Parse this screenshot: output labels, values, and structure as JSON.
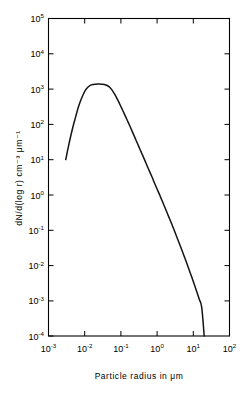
{
  "figure": {
    "background_color": "#ffffff",
    "ink_color": "#000000",
    "curve_color": "#141414"
  },
  "chart_data": {
    "type": "line",
    "title": "",
    "subtitle": "",
    "xlabel": "Particle  radius  in  μm",
    "ylabel": "dN/d(log r) cm⁻³ μm⁻¹",
    "xscale": "log",
    "yscale": "log",
    "xlim": [
      0.001,
      100
    ],
    "ylim": [
      0.0001,
      100000
    ],
    "grid": false,
    "legend": null,
    "legend_position": "none",
    "annotations": [],
    "xticks": [
      0.001,
      0.01,
      0.1,
      1,
      10,
      100
    ],
    "xtick_labels": [
      "10",
      "10",
      "10",
      "10",
      "10",
      "10"
    ],
    "xtick_exponents": [
      "-3",
      "-2",
      "-1",
      "0",
      "1",
      "2"
    ],
    "yticks": [
      0.0001,
      0.001,
      0.01,
      0.1,
      1,
      10,
      100,
      1000,
      10000,
      100000
    ],
    "ytick_labels": [
      "10",
      "10",
      "10",
      "10",
      "10",
      "10",
      "10",
      "10",
      "10",
      "10"
    ],
    "ytick_exponents": [
      "-4",
      "-3",
      "-2",
      "-1",
      "0",
      "1",
      "2",
      "3",
      "4",
      "5"
    ],
    "series": [
      {
        "name": "Aerosol size distribution",
        "x": [
          0.003,
          0.0035,
          0.0041,
          0.0048,
          0.0056,
          0.0065,
          0.0076,
          0.0089,
          0.0104,
          0.0122,
          0.0143,
          0.0167,
          0.0196,
          0.0229,
          0.0268,
          0.0314,
          0.0368,
          0.0431,
          0.0504,
          0.059,
          0.0691,
          0.0809,
          0.0947,
          0.111,
          0.13,
          0.152,
          0.178,
          0.208,
          0.244,
          0.285,
          0.334,
          0.391,
          0.458,
          0.536,
          0.627,
          0.734,
          0.859,
          1.006,
          1.177,
          1.378,
          1.613,
          1.888,
          2.21,
          2.587,
          3.028,
          3.544,
          4.148,
          4.855,
          5.683,
          6.652,
          7.786,
          9.113,
          10.67,
          12.48,
          14.61,
          17.1,
          20.0
        ],
        "y": [
          10.0,
          22.0,
          46.0,
          90.0,
          160.0,
          280.0,
          450.0,
          670.0,
          920.0,
          1130.0,
          1270.0,
          1340.0,
          1370.0,
          1380.0,
          1380.0,
          1370.0,
          1330.0,
          1240.0,
          1090.0,
          890.0,
          680.0,
          500.0,
          360.0,
          255.0,
          180.0,
          126.0,
          88.0,
          61.0,
          42.0,
          29.0,
          20.0,
          13.8,
          9.5,
          6.5,
          4.5,
          3.1,
          2.1,
          1.45,
          1.0,
          0.68,
          0.46,
          0.31,
          0.21,
          0.142,
          0.094,
          0.062,
          0.041,
          0.027,
          0.0175,
          0.0113,
          0.0072,
          0.0046,
          0.0029,
          0.0018,
          0.0011,
          0.00065,
          0.0001
        ],
        "peak_x": 0.023,
        "peak_y": 1380,
        "start_x": 0.003,
        "start_y": 10,
        "end_x": 20.0,
        "end_y": 0.0001
      }
    ]
  }
}
